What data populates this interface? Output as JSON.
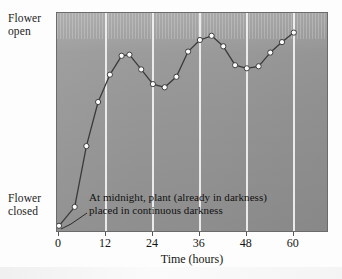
{
  "figure": {
    "y_axis": {
      "top_label_line1": "Flower",
      "top_label_line2": "open",
      "bottom_label_line1": "Flower",
      "bottom_label_line2": "closed"
    },
    "x_axis": {
      "title": "Time (hours)",
      "ticks": [
        "0",
        "12",
        "24",
        "36",
        "48",
        "60"
      ]
    },
    "annotation": {
      "line1": "At midnight, plant (already in darkness)",
      "line2": "placed in continuous darkness"
    },
    "colors": {
      "panel_left": "#9a9a9a",
      "panel_right": "#8f8f8f",
      "gridline": "#f2f2f2",
      "line": "#3a3a3a",
      "marker_fill": "#ffffff",
      "marker_stroke": "#2e2e2e",
      "frame": "#6b6b6b",
      "text": "#151515"
    }
  },
  "chart_data": {
    "type": "line",
    "title": "",
    "subtitle": "",
    "xlabel": "Time (hours)",
    "ylabel": "Flower state",
    "xlim": [
      0,
      69
    ],
    "ylim": [
      0,
      1
    ],
    "xticks": [
      0,
      12,
      24,
      36,
      48,
      60
    ],
    "ytick_labels": [
      "Flower closed",
      "Flower open"
    ],
    "grid": "vertical gridlines at every x tick (white)",
    "legend": "none",
    "annotations": [
      {
        "text": "At midnight, plant (already in darkness) placed in continuous darkness",
        "x": 0,
        "y": 0,
        "note": "leader line points to the first data point at time 0"
      }
    ],
    "series": [
      {
        "name": "Flower opening rhythm",
        "marker": "open circle",
        "x": [
          0,
          4,
          7,
          10,
          13,
          16,
          18,
          21,
          24,
          27,
          30,
          33,
          36,
          39,
          42,
          45,
          48,
          51,
          54,
          57,
          60
        ],
        "y": [
          0.015,
          0.105,
          0.395,
          0.605,
          0.735,
          0.825,
          0.83,
          0.76,
          0.69,
          0.675,
          0.725,
          0.845,
          0.9,
          0.92,
          0.87,
          0.78,
          0.765,
          0.775,
          0.84,
          0.89,
          0.935
        ]
      }
    ]
  }
}
